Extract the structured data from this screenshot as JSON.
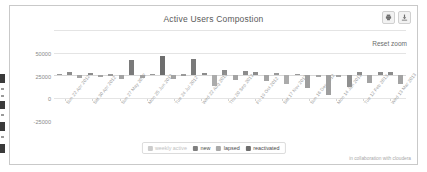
{
  "card": {
    "title": "Active Users Compostion",
    "reset_zoom_label": "Reset zoom",
    "credit": "in collaboration with cloudera",
    "export_icons": [
      {
        "name": "print-icon",
        "glyph": "print"
      },
      {
        "name": "download-icon",
        "glyph": "download"
      }
    ]
  },
  "legend": {
    "items": [
      {
        "label": "weekly active",
        "color": "#9a9a9a",
        "disabled": true
      },
      {
        "label": "new",
        "color": "#7f7f7f",
        "disabled": false
      },
      {
        "label": "lapsed",
        "color": "#a9a9a9",
        "disabled": false
      },
      {
        "label": "reactivated",
        "color": "#6e6e6e",
        "disabled": false
      }
    ]
  },
  "chart_data": {
    "type": "bar",
    "title": "Active Users Compostion",
    "xlabel": "",
    "ylabel": "",
    "ylim": [
      -25000,
      50000
    ],
    "yticks": [
      50000,
      25000,
      0,
      -25000
    ],
    "ytick_labels": [
      "50000",
      "25000",
      "0",
      "-25000"
    ],
    "grid": true,
    "legend_position": "bottom",
    "categories": [
      "Sun 22 Apr 2012",
      "Sun 29 Apr 2012",
      "Sun 06 May 2012",
      "Sun 13 May 2012",
      "Sun 20 May 2012",
      "Sun 27 May 2012",
      "Sun 03 Jun 2012",
      "Sun 10 Jun 2012",
      "Sun 17 Jun 2012",
      "Sun 24 Jun 2012",
      "Sun 01 Jul 2012",
      "Sun 08 Jul 2012",
      "Sun 15 Jul 2012",
      "Sun 22 Jul 2012",
      "Sun 29 Jul 2012",
      "Sun 05 Aug 2012",
      "Sun 12 Aug 2012",
      "Sun 19 Aug 2012",
      "Sun 26 Aug 2012",
      "Sun 02 Sep 2012",
      "Sun 09 Sep 2012",
      "Sun 16 Sep 2012",
      "Sun 23 Sep 2012",
      "Sun 30 Sep 2012",
      "Sun 07 Oct 2012",
      "Sun 14 Oct 2012",
      "Sun 21 Oct 2012",
      "Sun 28 Oct 2012",
      "Sun 04 Nov 2012",
      "Sun 11 Nov 2012",
      "Sun 18 Nov 2012",
      "Sun 25 Nov 2012",
      "Sun 02 Dec 2012",
      "Sun 09 Dec 2012"
    ],
    "tick_labels_shown": [
      "Sun 22 Apr 2012",
      "Sat 30 Apr 2012",
      "Sun 27 May 2012",
      "Mon 25 Jun 2012",
      "Tue 24 Jul 2012",
      "Wed 22 Aug 2012",
      "Thu 20 Sep 2012",
      "Fri 19 Oct 2012",
      "Sat 17 Nov 2012",
      "Sun 16 Dec 2012",
      "Mon 14 Jan 2013",
      "Tue 12 Feb 2013",
      "Wed 13 Mar 2013"
    ],
    "series": [
      {
        "name": "net change",
        "values": [
          1800,
          3200,
          -2800,
          2600,
          -900,
          1200,
          -4200,
          16500,
          -3100,
          1500,
          21500,
          -3900,
          1400,
          17800,
          3000,
          -11500,
          5800,
          -5200,
          4300,
          3500,
          -6700,
          2200,
          -9800,
          1600,
          -14500,
          -1000,
          -21500,
          -900,
          -13200,
          3800,
          -8200,
          4200,
          3900,
          -9400
        ]
      }
    ],
    "bars": [
      {
        "v": 1800,
        "c": "#9a9a9a"
      },
      {
        "v": 3200,
        "c": "#8c8c8c"
      },
      {
        "v": -2800,
        "c": "#a3a3a3"
      },
      {
        "v": 2600,
        "c": "#8c8c8c"
      },
      {
        "v": -900,
        "c": "#a3a3a3"
      },
      {
        "v": 1200,
        "c": "#9a9a9a"
      },
      {
        "v": -4200,
        "c": "#a3a3a3"
      },
      {
        "v": 16500,
        "c": "#7a7a7a"
      },
      {
        "v": -3100,
        "c": "#a3a3a3"
      },
      {
        "v": 1500,
        "c": "#9a9a9a"
      },
      {
        "v": 21500,
        "c": "#6e6e6e"
      },
      {
        "v": -3900,
        "c": "#a3a3a3"
      },
      {
        "v": 1400,
        "c": "#9a9a9a"
      },
      {
        "v": 17800,
        "c": "#7a7a7a"
      },
      {
        "v": 3000,
        "c": "#8c8c8c"
      },
      {
        "v": -11500,
        "c": "#ababab"
      },
      {
        "v": 5800,
        "c": "#8c8c8c"
      },
      {
        "v": -5200,
        "c": "#a3a3a3"
      },
      {
        "v": 4300,
        "c": "#8c8c8c"
      },
      {
        "v": 3500,
        "c": "#8c8c8c"
      },
      {
        "v": -6700,
        "c": "#a3a3a3"
      },
      {
        "v": 2200,
        "c": "#9a9a9a"
      },
      {
        "v": -9800,
        "c": "#ababab"
      },
      {
        "v": 1600,
        "c": "#9a9a9a"
      },
      {
        "v": -14500,
        "c": "#9e9e9e"
      },
      {
        "v": -1000,
        "c": "#a3a3a3"
      },
      {
        "v": -21500,
        "c": "#9e9e9e"
      },
      {
        "v": -900,
        "c": "#a3a3a3"
      },
      {
        "v": -13200,
        "c": "#8f8f8f"
      },
      {
        "v": 3800,
        "c": "#8c8c8c"
      },
      {
        "v": -8200,
        "c": "#a3a3a3"
      },
      {
        "v": 4200,
        "c": "#8c8c8c"
      },
      {
        "v": 3900,
        "c": "#8c8c8c"
      },
      {
        "v": -9400,
        "c": "#a3a3a3"
      }
    ]
  }
}
